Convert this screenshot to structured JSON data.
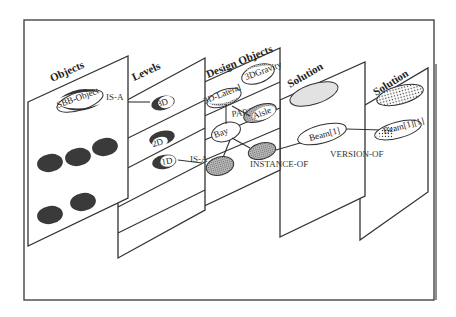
{
  "diagram": {
    "planes": [
      {
        "title": "Objects"
      },
      {
        "title": "Levels"
      },
      {
        "title": "Design Objects"
      },
      {
        "title": "Solution"
      },
      {
        "title": "Solution"
      }
    ],
    "nodes": {
      "sbb_object": "SBB-Object",
      "level_3d": "3D",
      "level_2d": "2D",
      "level_1d": "1D",
      "lateral_3d": "3D-Lateral",
      "gravity_3d": "3DGravity",
      "aisle": "Aisle",
      "bay": "Bay",
      "beam1": "Beam[1]",
      "beam11": "Beam[1][1]"
    },
    "relations": {
      "is_a_top": "IS-A",
      "is_a_mid": "IS-A",
      "part_of": "PART-OF",
      "instance_of": "INSTANCE-OF",
      "version_of": "VERSION-OF"
    },
    "colors": {
      "dark_fill": "#3a3a3a",
      "gray_fill": "#9a9a9a",
      "light_fill": "#dcdcdc",
      "stroke": "#333333"
    }
  }
}
